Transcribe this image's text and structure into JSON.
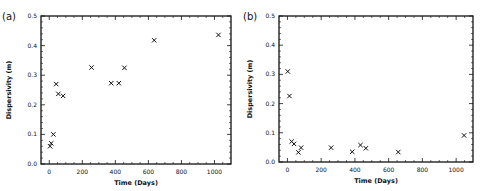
{
  "chart_data": [
    {
      "panel_label": "(a)",
      "type": "scatter",
      "title": "",
      "xlabel": "Time (Days)",
      "ylabel": "Dispersivity (m)",
      "xlim": [
        -50,
        1100
      ],
      "ylim": [
        0.0,
        0.5
      ],
      "xticks": [
        0,
        200,
        400,
        600,
        800,
        1000
      ],
      "yticks": [
        0.0,
        0.1,
        0.2,
        0.3,
        0.4,
        0.5
      ],
      "ytick_labels": [
        "0.0",
        "0.1",
        "0.2",
        "0.3",
        "0.4",
        "0.5"
      ],
      "grid": false,
      "legend": null,
      "marker": "x",
      "x": [
        5,
        12,
        25,
        42,
        55,
        84,
        256,
        375,
        421,
        455,
        635,
        1024
      ],
      "y": [
        0.06,
        0.07,
        0.1,
        0.27,
        0.237,
        0.23,
        0.326,
        0.273,
        0.273,
        0.325,
        0.418,
        0.436
      ]
    },
    {
      "panel_label": "(b)",
      "type": "scatter",
      "title": "",
      "xlabel": "Time (Days)",
      "ylabel": "Dispersivity (m)",
      "xlim": [
        -50,
        1100
      ],
      "ylim": [
        0.0,
        0.5
      ],
      "xticks": [
        0,
        200,
        400,
        600,
        800,
        1000
      ],
      "yticks": [
        0.0,
        0.1,
        0.2,
        0.3,
        0.4,
        0.5
      ],
      "ytick_labels": [
        "0.0",
        "0.1",
        "0.2",
        "0.3",
        "0.4",
        "0.5"
      ],
      "grid": false,
      "legend": null,
      "marker": "x",
      "x": [
        2,
        12,
        25,
        39,
        65,
        81,
        259,
        384,
        433,
        465,
        657,
        1047
      ],
      "y": [
        0.31,
        0.226,
        0.07,
        0.062,
        0.033,
        0.049,
        0.049,
        0.035,
        0.058,
        0.047,
        0.034,
        0.091
      ]
    }
  ]
}
